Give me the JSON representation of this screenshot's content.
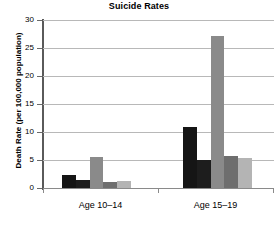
{
  "chart_data": {
    "type": "bar",
    "title": "Suicide Rates",
    "xlabel": "",
    "ylabel": "Death Rate (per 100,000 population)",
    "categories": [
      "Age 10–14",
      "Age 15–19"
    ],
    "ylim": [
      0,
      30
    ],
    "yticks": [
      0,
      5,
      10,
      15,
      20,
      25,
      30
    ],
    "ytick_labels": [
      "0",
      "5",
      "10",
      "15",
      "20",
      "25",
      "30"
    ],
    "grid": true,
    "legend": "none",
    "series": [
      {
        "name": "series-1",
        "color": "#151515",
        "values": [
          2.3,
          10.9
        ]
      },
      {
        "name": "series-2",
        "color": "#1d1d1d",
        "values": [
          1.5,
          5.0
        ]
      },
      {
        "name": "series-3",
        "color": "#8a8a8a",
        "values": [
          5.6,
          27.1
        ]
      },
      {
        "name": "series-4",
        "color": "#6e6e6e",
        "values": [
          1.0,
          5.7
        ]
      },
      {
        "name": "series-5",
        "color": "#b4b4b4",
        "values": [
          1.3,
          5.4
        ]
      }
    ]
  },
  "axis": {
    "y_title": "Death Rate (per 100,000 population)",
    "tick_30": "30",
    "tick_25": "25",
    "tick_20": "20",
    "tick_15": "15",
    "tick_10": "10",
    "tick_5": "5",
    "tick_0": "0",
    "cat_0": "Age 10–14",
    "cat_1": "Age 15–19"
  },
  "header": {
    "title": "Suicide Rates"
  }
}
